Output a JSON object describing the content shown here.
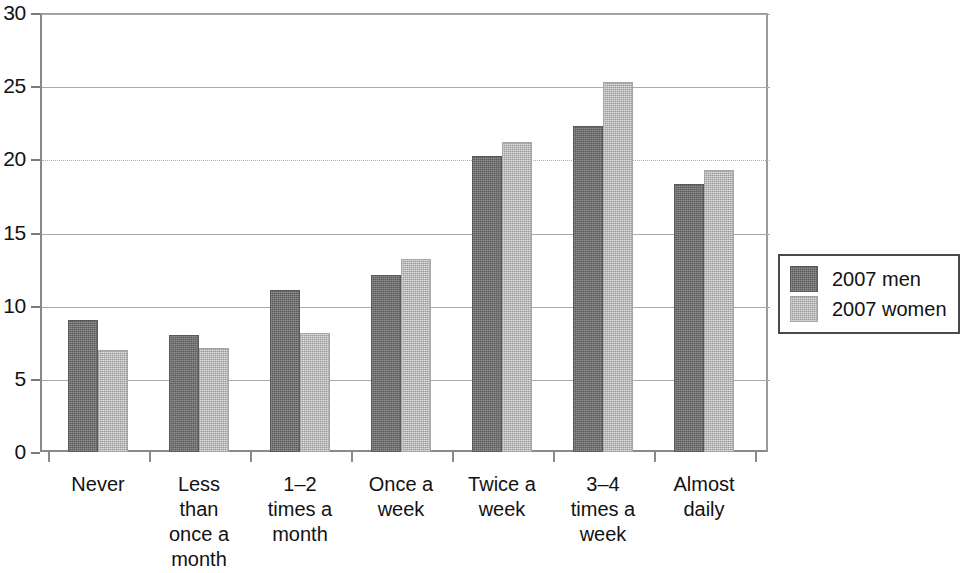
{
  "chart_data": {
    "type": "bar",
    "title": "",
    "subtitle": "",
    "xlabel": "",
    "ylabel": "",
    "ylim": [
      0,
      30
    ],
    "yticks": [
      0,
      5,
      10,
      15,
      20,
      25,
      30
    ],
    "ytick_labels": [
      "0",
      "5",
      "10",
      "15",
      "20",
      "25",
      "30"
    ],
    "grid": true,
    "legend_position": "right",
    "categories": [
      "Never",
      "Less\nthan\nonce a\nmonth",
      "1–2\ntimes a\nmonth",
      "Once a\nweek",
      "Twice a\nweek",
      "3–4\ntimes a\nweek",
      "Almost\ndaily"
    ],
    "series": [
      {
        "name": "2007 men",
        "color": "#6f6f6f",
        "values": [
          9.0,
          8.0,
          11.1,
          12.1,
          20.2,
          22.3,
          18.3
        ]
      },
      {
        "name": "2007 women",
        "color": "#bbbbbb",
        "values": [
          7.0,
          7.1,
          8.1,
          13.2,
          21.2,
          25.3,
          19.3
        ]
      }
    ]
  },
  "legend": {
    "entries": [
      {
        "label": "2007 men"
      },
      {
        "label": "2007 women"
      }
    ]
  }
}
